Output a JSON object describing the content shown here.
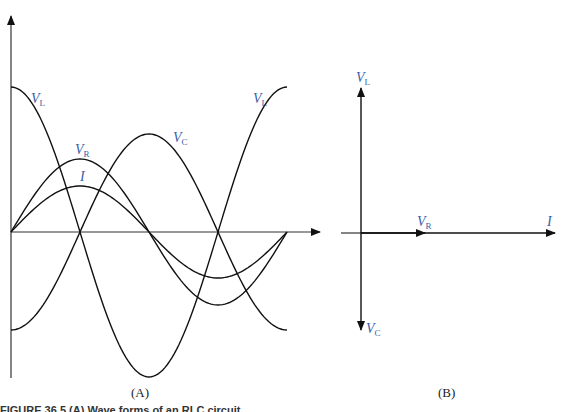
{
  "figure": {
    "panels": [
      {
        "id": "A",
        "label": "(A)"
      },
      {
        "id": "B",
        "label": "(B)"
      }
    ],
    "caption_fragment": "FIGURE 36.5  (A) Wave forms of an RLC circuit..."
  },
  "panel_a": {
    "curves": [
      {
        "name": "V_L",
        "main": "V",
        "sub": "L",
        "function": "cos",
        "amplitude": 145,
        "color": "#111111"
      },
      {
        "name": "V_C",
        "main": "V",
        "sub": "C",
        "function": "-cos",
        "amplitude": 98,
        "color": "#111111"
      },
      {
        "name": "V_R",
        "main": "V",
        "sub": "R",
        "function": "sin",
        "amplitude": 73,
        "color": "#111111"
      },
      {
        "name": "I",
        "main": "I",
        "sub": "",
        "function": "sin",
        "amplitude": 46,
        "color": "#111111"
      }
    ],
    "labels": {
      "vl_left": {
        "main": "V",
        "sub": "L"
      },
      "vl_right": {
        "main": "V",
        "sub": "L"
      },
      "vr": {
        "main": "V",
        "sub": "R"
      },
      "i": {
        "main": "I"
      },
      "vc": {
        "main": "V",
        "sub": "C"
      }
    }
  },
  "panel_b": {
    "phasors": [
      {
        "name": "V_L",
        "direction": "up"
      },
      {
        "name": "V_C",
        "direction": "down"
      },
      {
        "name": "V_R",
        "direction": "right"
      },
      {
        "name": "I",
        "direction": "right"
      }
    ],
    "labels": {
      "vl": {
        "main": "V",
        "sub": "L"
      },
      "vc": {
        "main": "V",
        "sub": "C"
      },
      "vr": {
        "main": "V",
        "sub": "R"
      },
      "i": {
        "main": "I"
      }
    }
  },
  "colors": {
    "label_blue": "#3a5fa8",
    "line": "#111111",
    "background": "#ffffff"
  }
}
